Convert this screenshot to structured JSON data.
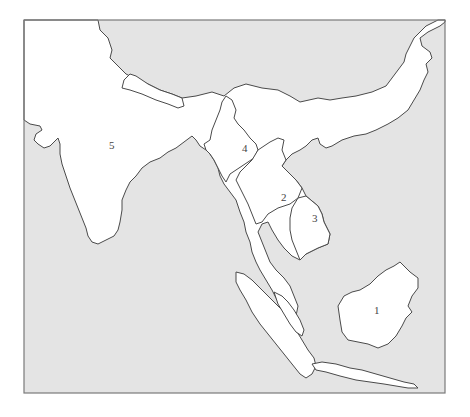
{
  "map": {
    "title": "",
    "colors": {
      "sea": "#e4e4e4",
      "land": "#ffffff",
      "border": "#4a4a4a",
      "frame": "#7a7a7a",
      "label": "#444444"
    },
    "regions": [
      {
        "id": "1",
        "label": "1",
        "x": 377,
        "y": 310
      },
      {
        "id": "2",
        "label": "2",
        "x": 284,
        "y": 197
      },
      {
        "id": "3",
        "label": "3",
        "x": 315,
        "y": 218
      },
      {
        "id": "4",
        "label": "4",
        "x": 245,
        "y": 148
      },
      {
        "id": "5",
        "label": "5",
        "x": 112,
        "y": 145
      }
    ]
  }
}
